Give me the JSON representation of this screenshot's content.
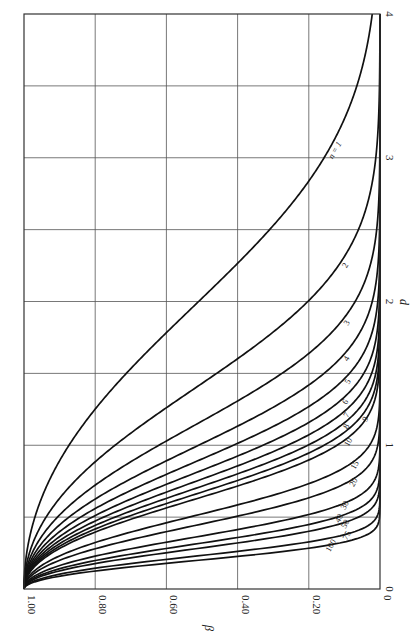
{
  "chart_data": {
    "type": "line",
    "title": "",
    "orientation": "rotated 90 degrees clockwise (d axis vertical on right, beta axis horizontal at bottom)",
    "xlabel": "d",
    "ylabel": "β",
    "xlim": [
      0,
      4
    ],
    "ylim": [
      0,
      1.0
    ],
    "x_ticks": [
      "0",
      "1",
      "2",
      "3",
      "4"
    ],
    "y_ticks": [
      "1.00",
      "0.80",
      "0.60",
      "0.40",
      "0.20",
      "0"
    ],
    "grid": true,
    "grid_x_step": 0.5,
    "grid_y_step": 0.2,
    "legend": "inline curve labels",
    "formula": "beta(d) = Phi(1.96 - d*sqrt(n)) - Phi(-1.96 - d*sqrt(n))",
    "series": [
      {
        "name": "n = 1",
        "n": 1,
        "label": "n = 1",
        "label_at_d": 3.05
      },
      {
        "name": "2",
        "n": 2,
        "label": "2",
        "label_at_d": 2.25
      },
      {
        "name": "3",
        "n": 3,
        "label": "3",
        "label_at_d": 1.85
      },
      {
        "name": "4",
        "n": 4,
        "label": "4",
        "label_at_d": 1.6
      },
      {
        "name": "5",
        "n": 5,
        "label": "5",
        "label_at_d": 1.44
      },
      {
        "name": "6",
        "n": 6,
        "label": "6",
        "label_at_d": 1.3
      },
      {
        "name": "7",
        "n": 7,
        "label": "7",
        "label_at_d": 1.21
      },
      {
        "name": "8",
        "n": 8,
        "label": "8",
        "label_at_d": 1.13
      },
      {
        "name": "9",
        "n": 9,
        "label": "9",
        "label_at_d": 1.18
      },
      {
        "name": "10",
        "n": 10,
        "label": "10",
        "label_at_d": 1.02
      },
      {
        "name": "15",
        "n": 15,
        "label": "15",
        "label_at_d": 0.86
      },
      {
        "name": "20",
        "n": 20,
        "label": "20",
        "label_at_d": 0.74
      },
      {
        "name": "30",
        "n": 30,
        "label": "30",
        "label_at_d": 0.58
      },
      {
        "name": "40",
        "n": 40,
        "label": "40",
        "label_at_d": 0.49
      },
      {
        "name": "50",
        "n": 50,
        "label": "50",
        "label_at_d": 0.45
      },
      {
        "name": "75",
        "n": 75,
        "label": "75",
        "label_at_d": 0.37
      },
      {
        "name": "100",
        "n": 100,
        "label": "100",
        "label_at_d": 0.3
      }
    ],
    "sample_values": {
      "d": [
        0,
        0.5,
        1.0,
        1.5,
        2.0,
        3.0
      ],
      "n=1": [
        0.95,
        0.92,
        0.83,
        0.68,
        0.48,
        0.15
      ],
      "n=4": [
        0.95,
        0.83,
        0.48,
        0.15,
        0.02,
        0.0
      ],
      "n=16": [
        0.95,
        0.48,
        0.02,
        0.0,
        0.0,
        0.0
      ],
      "n=100": [
        0.95,
        0.0,
        0.0,
        0.0,
        0.0,
        0.0
      ]
    }
  },
  "labels": {
    "x_axis_title": "d",
    "y_axis_title": "β"
  }
}
